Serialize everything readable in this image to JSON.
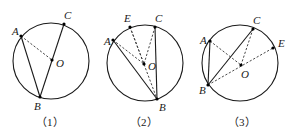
{
  "figures": [
    {
      "caption": "（1）",
      "labels": {
        "A": "A",
        "B": "B",
        "C": "C",
        "O": "O"
      }
    },
    {
      "caption": "（2）",
      "labels": {
        "A": "A",
        "B": "B",
        "C": "C",
        "E": "E",
        "O": "O"
      }
    },
    {
      "caption": "（3）",
      "labels": {
        "A": "A",
        "B": "B",
        "C": "C",
        "E": "E",
        "O": "O"
      }
    }
  ],
  "colors": {
    "stroke": "#1a1a1a",
    "background": "#ffffff"
  }
}
